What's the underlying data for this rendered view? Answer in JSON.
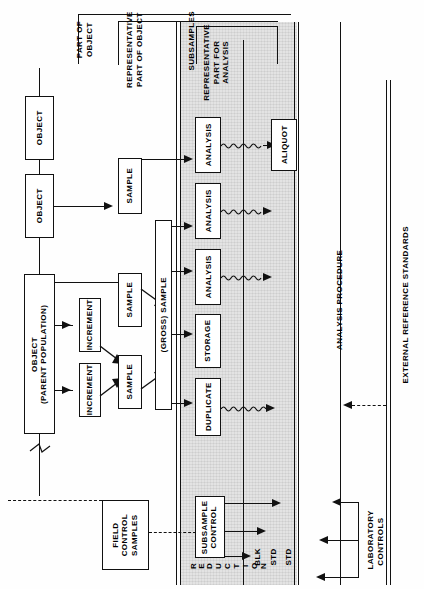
{
  "diagram": {
    "orientation": "rotated-90-ccw",
    "accent_color": "#111111",
    "band_color": "#e3e3e3"
  },
  "objects": {
    "object_top": "OBJECT",
    "object_mid": "OBJECT",
    "object_parent": "OBJECT\n(PARENT POPULATION)"
  },
  "increments": [
    {
      "label": "INCREMENT"
    },
    {
      "label": "INCREMENT"
    }
  ],
  "samples": [
    {
      "label": "SAMPLE",
      "id": "sample-top"
    },
    {
      "label": "SAMPLE",
      "id": "sample-mid"
    },
    {
      "label": "SAMPLE",
      "id": "sample-low"
    }
  ],
  "gross_sample": "(GROSS) SAMPLE",
  "field_control": "FIELD\nCONTROL\nSAMPLES",
  "band_boxes": [
    {
      "label": "ANALYSIS",
      "id": "analysis-1"
    },
    {
      "label": "ANALYSIS",
      "id": "analysis-2"
    },
    {
      "label": "ANALYSIS",
      "id": "analysis-3"
    },
    {
      "label": "STORAGE",
      "id": "storage"
    },
    {
      "label": "DUPLICATE",
      "id": "duplicate"
    },
    {
      "label": "SUBSAMPLE\nCONTROL",
      "id": "subsample-control"
    }
  ],
  "aliquot": "ALIQUOT",
  "brackets": {
    "part_of_object": "PART OF\nOBJECT",
    "representative_part_of_object": "REPRESENTATIVE\nPART OF OBJECT",
    "subsamples": "SUBSAMPLES",
    "representative_part_for_analysis": "REPRESENTATIVE\nPART FOR\nANALYSIS"
  },
  "reduction_letters": [
    "R",
    "E",
    "D",
    "U",
    "C",
    "T",
    "I",
    "O",
    "N"
  ],
  "reduction_word": "REDUCTION",
  "control_outputs": [
    {
      "label": "STD"
    },
    {
      "label": "STD"
    },
    {
      "label": "BLK"
    }
  ],
  "procedures": {
    "analysis_procedure": "ANALYSIS PROCEDURE",
    "laboratory_controls": "LABORATORY\nCONTROLS",
    "external_reference_standards": "EXTERNAL REFERENCE STANDARDS"
  }
}
